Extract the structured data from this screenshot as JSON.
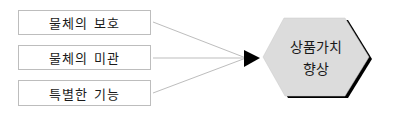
{
  "diagram": {
    "inputs": [
      {
        "label": "물체의 보호"
      },
      {
        "label": "물체의 미관"
      },
      {
        "label": "특별한 기능"
      }
    ],
    "target": {
      "line1": "상품가치",
      "line2": "향상",
      "shape": "hexagon",
      "fill_color": "#dcdcdc",
      "shadow_color": "#000000"
    },
    "connector_color": "#bdbdbd",
    "arrow_color": "#000000"
  }
}
